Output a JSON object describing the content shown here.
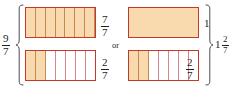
{
  "figure": {
    "connector_label": "or",
    "colors": {
      "fill": "#f8daae",
      "border": "#c0392b",
      "divider_empty": "#d9848a",
      "divider_filled": "#c58a52",
      "text": "#231f20",
      "brace": "#4a4f52",
      "background": "#ffffff"
    }
  },
  "left_group": {
    "brace_label": {
      "type": "fraction",
      "numerator": "9",
      "denominator": "7",
      "text": "9/7"
    },
    "bars": [
      {
        "name": "top-bar",
        "total_parts": 7,
        "filled_parts": 7,
        "label": {
          "type": "fraction",
          "numerator": "7",
          "denominator": "7",
          "text": "7/7"
        }
      },
      {
        "name": "bottom-bar",
        "total_parts": 7,
        "filled_parts": 2,
        "label": {
          "type": "fraction",
          "numerator": "2",
          "denominator": "7",
          "text": "2/7"
        }
      }
    ]
  },
  "right_group": {
    "brace_label": {
      "type": "mixed",
      "whole": "1",
      "numerator": "2",
      "denominator": "7",
      "text": "1 2/7"
    },
    "bars": [
      {
        "name": "top-bar",
        "total_parts": 1,
        "filled_parts": 1,
        "label": {
          "type": "integer",
          "text": "1"
        }
      },
      {
        "name": "bottom-bar",
        "total_parts": 7,
        "filled_parts": 2,
        "label": {
          "type": "fraction",
          "numerator": "2",
          "denominator": "7",
          "text": "2/7"
        }
      }
    ]
  }
}
